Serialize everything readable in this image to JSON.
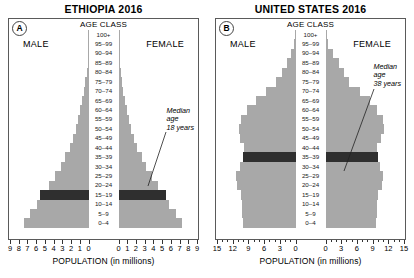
{
  "figure": {
    "panels": [
      {
        "letter": "A",
        "title": "ETHIOPIA 2016",
        "age_class_title": "AGE CLASS",
        "male_label": "MALE",
        "female_label": "FEMALE",
        "axis_title": "POPULATION (in millions)",
        "annotation": {
          "line1": "Median",
          "line2": "age",
          "line3": "18 years"
        },
        "axis_max": 9,
        "tick_labels_left": [
          "9",
          "8",
          "7",
          "6",
          "5",
          "4",
          "3",
          "2",
          "1",
          "0"
        ],
        "tick_labels_right": [
          "0",
          "1",
          "2",
          "3",
          "4",
          "5",
          "6",
          "7",
          "8",
          "9"
        ]
      },
      {
        "letter": "B",
        "title": "UNITED STATES 2016",
        "age_class_title": "AGE CLASS",
        "male_label": "MALE",
        "female_label": "FEMALE",
        "axis_title": "POPULATION (in millions)",
        "annotation": {
          "line1": "Median",
          "line2": "age",
          "line3": "38 years"
        },
        "axis_max": 15,
        "tick_labels_left": [
          "15",
          "12",
          "9",
          "6",
          "3",
          "0"
        ],
        "tick_labels_right": [
          "0",
          "3",
          "6",
          "9",
          "12",
          "15"
        ]
      }
    ]
  },
  "colors": {
    "bar": "#a8a8a8",
    "highlight": "#2f2f2f",
    "frame": "#5a5a5a",
    "text": "#000000"
  },
  "chart_data": [
    {
      "type": "bar",
      "title": "ETHIOPIA 2016",
      "subtitle": "Population pyramid",
      "xlabel": "POPULATION (in millions)",
      "ylabel": "AGE CLASS",
      "xlim": [
        -9,
        9
      ],
      "xticks": [
        -9,
        -8,
        -7,
        -6,
        -5,
        -4,
        -3,
        -2,
        -1,
        0,
        1,
        2,
        3,
        4,
        5,
        6,
        7,
        8,
        9
      ],
      "grid": false,
      "legend": "none",
      "orientation": "horizontal-diverging",
      "highlight_category": "15-19",
      "annotation": "Median age 18 years",
      "categories": [
        "0-4",
        "5-9",
        "10-14",
        "15-19",
        "20-24",
        "25-29",
        "30-34",
        "35-39",
        "40-44",
        "45-49",
        "50-54",
        "55-59",
        "60-64",
        "65-69",
        "70-74",
        "75-79",
        "80-84",
        "85-89",
        "90-94",
        "95-99",
        "100+"
      ],
      "series": [
        {
          "name": "MALE",
          "side": "left",
          "values": [
            7.5,
            6.8,
            6.0,
            5.6,
            4.6,
            3.9,
            3.2,
            2.7,
            2.2,
            1.8,
            1.5,
            1.2,
            1.0,
            0.75,
            0.55,
            0.38,
            0.22,
            0.11,
            0.05,
            0.02,
            0.01
          ]
        },
        {
          "name": "FEMALE",
          "side": "right",
          "values": [
            7.4,
            6.7,
            5.9,
            5.5,
            4.6,
            3.9,
            3.2,
            2.7,
            2.2,
            1.8,
            1.5,
            1.2,
            1.0,
            0.78,
            0.58,
            0.4,
            0.24,
            0.12,
            0.055,
            0.02,
            0.01
          ]
        }
      ]
    },
    {
      "type": "bar",
      "title": "UNITED STATES 2016",
      "subtitle": "Population pyramid",
      "xlabel": "POPULATION (in millions)",
      "ylabel": "AGE CLASS",
      "xlim": [
        -15,
        15
      ],
      "xticks": [
        -15,
        -12,
        -9,
        -6,
        -3,
        0,
        3,
        6,
        9,
        12,
        15
      ],
      "grid": false,
      "legend": "none",
      "orientation": "horizontal-diverging",
      "highlight_category": "35-39",
      "annotation": "Median age 38 years",
      "categories": [
        "0-4",
        "5-9",
        "10-14",
        "15-19",
        "20-24",
        "25-29",
        "30-34",
        "35-39",
        "40-44",
        "45-49",
        "50-54",
        "55-59",
        "60-64",
        "65-69",
        "70-74",
        "75-79",
        "80-84",
        "85-89",
        "90-94",
        "95-99",
        "100+"
      ],
      "series": [
        {
          "name": "MALE",
          "side": "left",
          "values": [
            10.2,
            10.3,
            10.4,
            10.6,
            11.4,
            11.6,
            10.8,
            10.2,
            9.9,
            10.7,
            11.0,
            10.6,
            9.3,
            7.7,
            5.8,
            3.8,
            2.6,
            1.7,
            0.85,
            0.25,
            0.05
          ]
        },
        {
          "name": "FEMALE",
          "side": "right",
          "values": [
            9.8,
            9.9,
            10.0,
            10.1,
            10.9,
            11.2,
            10.6,
            10.1,
            9.9,
            10.8,
            11.3,
            11.1,
            10.0,
            8.6,
            6.7,
            4.6,
            3.5,
            2.6,
            1.5,
            0.55,
            0.12
          ]
        }
      ]
    }
  ]
}
